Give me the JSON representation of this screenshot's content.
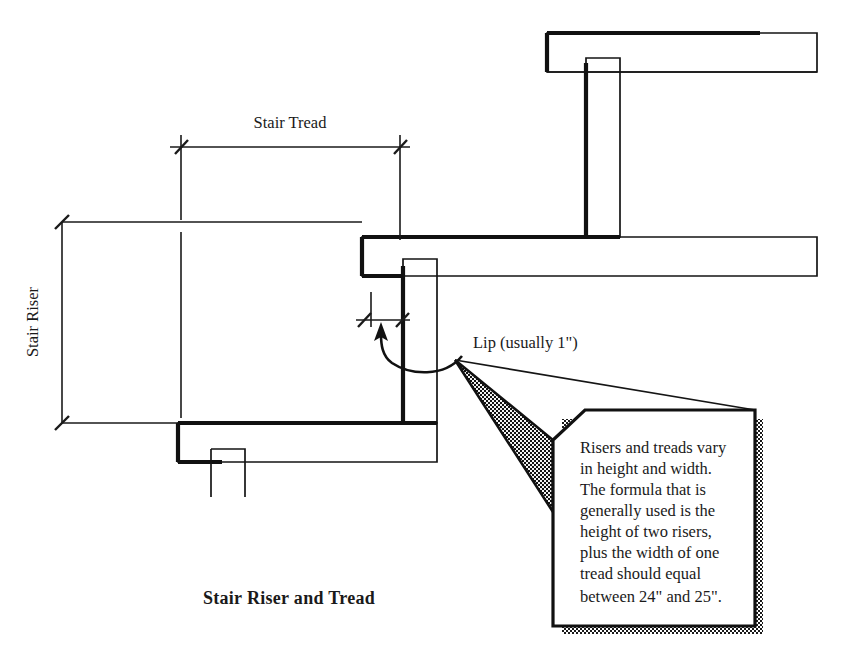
{
  "figure": {
    "title": "Stair Riser and Tread",
    "background_color": "#ffffff",
    "line_color": "#111111"
  },
  "dimensions": [
    {
      "id": "stair-tread",
      "label": "Stair Tread",
      "orientation": "horizontal",
      "label_position": "above"
    },
    {
      "id": "stair-riser",
      "label": "Stair Riser",
      "orientation": "vertical",
      "label_position": "left",
      "rotation_deg": -90
    }
  ],
  "callouts": [
    {
      "id": "lip",
      "label": "Lip (usually 1\")",
      "pointer": "curved-arrow"
    }
  ],
  "note_box": {
    "lines": [
      "Risers and treads vary",
      "in height and width.",
      "The formula that is",
      "generally used is the",
      "height of two risers,",
      "plus the width of one",
      "tread should equal",
      "between 24\" and 25\"."
    ],
    "shadow": "dotted-halftone"
  }
}
